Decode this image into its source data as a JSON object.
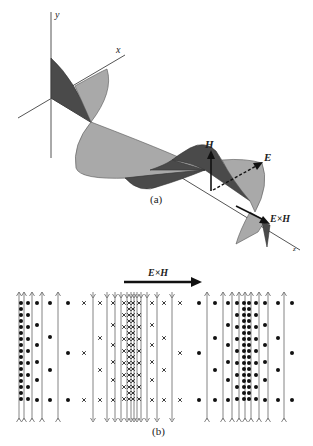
{
  "figure": {
    "part_a": {
      "caption": "(a)",
      "axes": {
        "x_label": "x",
        "y_label": "y",
        "z_label": "z"
      },
      "vectors": {
        "H_label": "H",
        "E_label": "E",
        "poynting_label": "E×H"
      },
      "colors": {
        "magnetic_lobe": "#4a4a4a",
        "electric_lobe": "#a9a9a9"
      }
    },
    "part_b": {
      "caption": "(b)",
      "arrow_label": "E×H",
      "field_lines": {
        "left_up_x": [
          19,
          24,
          32,
          42,
          58
        ],
        "middle_down_x": [
          93,
          107,
          115,
          121,
          127,
          131,
          134,
          137,
          141,
          147,
          157,
          172
        ],
        "right_up_x": [
          207,
          223,
          232,
          239,
          245,
          251,
          259,
          268,
          284
        ]
      },
      "symbols": {
        "left": "dot (out of page)",
        "middle": "cross (into page)",
        "right": "dot (out of page)"
      }
    }
  }
}
